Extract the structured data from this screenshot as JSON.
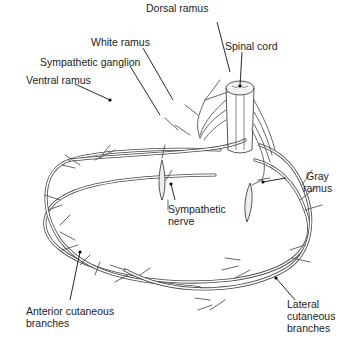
{
  "figure": {
    "labels": {
      "dorsal_ramus": "Dorsal ramus",
      "white_ramus": "White ramus",
      "spinal_cord": "Spinal cord",
      "sympathetic_ganglion": "Sympathetic ganglion",
      "ventral_ramus": "Ventral ramus",
      "gray_ramus_line1": "Gray",
      "gray_ramus_line2": "ramus",
      "sympathetic_nerve_line1": "Sympathetic",
      "sympathetic_nerve_line2": "nerve",
      "anterior_cutaneous_line1": "Anterior cutaneous",
      "anterior_cutaneous_line2": "branches",
      "lateral_cutaneous_line1": "Lateral",
      "lateral_cutaneous_line2": "cutaneous",
      "lateral_cutaneous_line3": "branches"
    },
    "colors": {
      "line": "#444444",
      "background": "#ffffff",
      "text": "#222222"
    }
  }
}
